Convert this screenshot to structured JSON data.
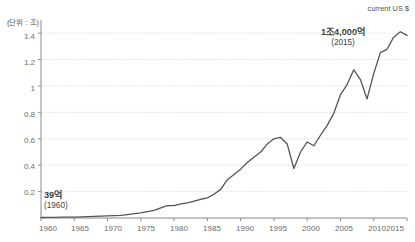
{
  "header": {
    "note": "current US $"
  },
  "axes": {
    "y_unit_label": "(단위 : 조)",
    "y_ticks": [
      "0.2",
      "0.4",
      "0.6",
      "0.8",
      "1",
      "1.2",
      "1.4"
    ],
    "x_ticks": [
      "1960",
      "1965",
      "1970",
      "1975",
      "1980",
      "1985",
      "1990",
      "1995",
      "2000",
      "2005",
      "2010",
      "2015"
    ]
  },
  "annotations": {
    "start": {
      "value": "39억",
      "year": "(1960)"
    },
    "end": {
      "value": "1조4,000억",
      "year": "(2015)"
    }
  },
  "style": {
    "line_color": "#555555",
    "grid_color": "#cccccc",
    "axis_color": "#8a8a8a",
    "text_color": "#6b6b6b"
  },
  "chart_data": {
    "type": "line",
    "title": "",
    "subtitle": "",
    "xlabel": "",
    "ylabel": "(단위 : 조)",
    "unit_note": "current US $",
    "grid": true,
    "legend": "none",
    "xlim": [
      1960,
      2015
    ],
    "ylim": [
      0,
      1.5
    ],
    "x": [
      1960,
      1961,
      1962,
      1963,
      1964,
      1965,
      1966,
      1967,
      1968,
      1969,
      1970,
      1971,
      1972,
      1973,
      1974,
      1975,
      1976,
      1977,
      1978,
      1979,
      1980,
      1981,
      1982,
      1983,
      1984,
      1985,
      1986,
      1987,
      1988,
      1989,
      1990,
      1991,
      1992,
      1993,
      1994,
      1995,
      1996,
      1997,
      1998,
      1999,
      2000,
      2001,
      2002,
      2003,
      2004,
      2005,
      2006,
      2007,
      2008,
      2009,
      2010,
      2011,
      2012,
      2013,
      2014,
      2015
    ],
    "values": [
      0.0039,
      0.0042,
      0.0048,
      0.006,
      0.0062,
      0.0072,
      0.0087,
      0.0099,
      0.0116,
      0.014,
      0.0162,
      0.018,
      0.0197,
      0.026,
      0.0333,
      0.0382,
      0.0475,
      0.0577,
      0.0766,
      0.093,
      0.0942,
      0.107,
      0.1145,
      0.128,
      0.142,
      0.152,
      0.18,
      0.217,
      0.29,
      0.33,
      0.37,
      0.42,
      0.46,
      0.5,
      0.56,
      0.6,
      0.61,
      0.56,
      0.375,
      0.5,
      0.576,
      0.547,
      0.627,
      0.702,
      0.793,
      0.934,
      1.011,
      1.123,
      1.049,
      0.902,
      1.094,
      1.253,
      1.278,
      1.37,
      1.411,
      1.383
    ],
    "series_name": "GDP (current US$)",
    "annotations": [
      {
        "x": 1960,
        "y": 0.0039,
        "label": "39억 (1960)"
      },
      {
        "x": 2015,
        "y": 1.383,
        "label": "1조4,000억 (2015)"
      }
    ]
  }
}
